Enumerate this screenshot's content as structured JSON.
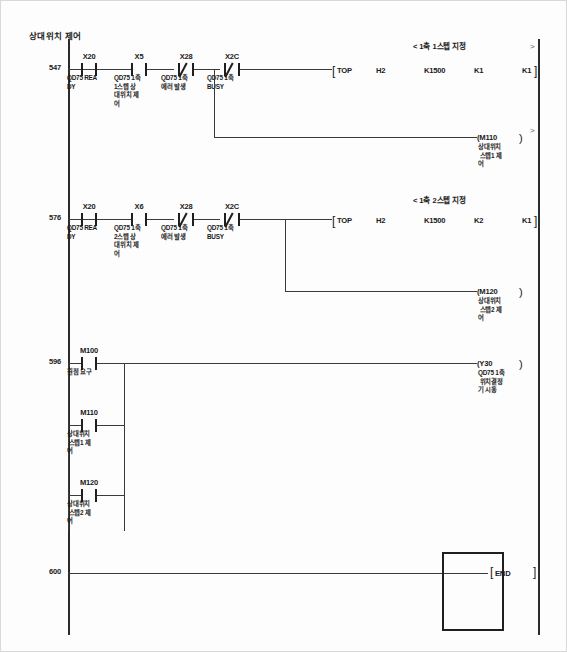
{
  "document": {
    "title": "상대위치 제어",
    "left_rail_label": "",
    "end_label": "END"
  },
  "rungs": [
    {
      "number": "547",
      "statement": "< 1축 1스텝 지정",
      "contacts": [
        {
          "name": "X20",
          "type": "no",
          "comment": "QD75 REA\nDY"
        },
        {
          "name": "X5",
          "type": "no",
          "comment": "QD75 1축\n1스텝 상\n대위치 제\n어"
        },
        {
          "name": "X28",
          "type": "nc",
          "comment": "QD75 1축\n에러 발생"
        },
        {
          "name": "X2C",
          "type": "nc",
          "comment": "QD75 1축\nBUSY"
        }
      ],
      "instruction": {
        "open": "[",
        "op": "TOP",
        "args": [
          "H2",
          "K1500",
          "K1",
          "K1"
        ],
        "close": "]"
      },
      "coil": {
        "name": "M110",
        "open": "(",
        "close": ")",
        "comment": "상대위치\n 스텝1 제\n어"
      }
    },
    {
      "number": "576",
      "statement": "< 1축 2스텝 지정",
      "contacts": [
        {
          "name": "X20",
          "type": "no",
          "comment": "QD75 REA\nDY"
        },
        {
          "name": "X6",
          "type": "no",
          "comment": "QD75 1축\n2스텝 상\n대위치 제\n어"
        },
        {
          "name": "X28",
          "type": "nc",
          "comment": "QD75 1축\n에러 발생"
        },
        {
          "name": "X2C",
          "type": "nc",
          "comment": "QD75 1축\nBUSY"
        }
      ],
      "instruction": {
        "open": "[",
        "op": "TOP",
        "args": [
          "H2",
          "K1500",
          "K2",
          "K1"
        ],
        "close": "]"
      },
      "coil": {
        "name": "M120",
        "open": "(",
        "close": ")",
        "comment": "상대위치\n 스텝2 제\n어"
      }
    },
    {
      "number": "596",
      "statement": "",
      "branches": [
        {
          "name": "M100",
          "type": "no",
          "comment": "원점 요구"
        },
        {
          "name": "M110",
          "type": "no",
          "comment": "상대위치\n 스텝1 제\n어"
        },
        {
          "name": "M120",
          "type": "no",
          "comment": "상대위치\n 스텝2 제\n어"
        }
      ],
      "coil": {
        "name": "Y30",
        "open": "(",
        "close": ")",
        "comment": "QD75 1축\n 위치결정\n기 시동"
      }
    },
    {
      "number": "600",
      "statement": "",
      "instruction": {
        "open": "[",
        "op": "END",
        "args": [],
        "close": "]"
      }
    }
  ],
  "edge_markers": {
    "top": ">",
    "mid": ">"
  }
}
